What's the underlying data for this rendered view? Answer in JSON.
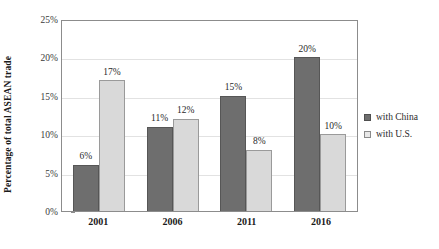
{
  "chart_data": {
    "type": "bar",
    "title": "",
    "subtitle": "",
    "xlabel": "",
    "ylabel": "Percentage of total ASEAN trade",
    "categories": [
      "2001",
      "2006",
      "2011",
      "2016"
    ],
    "series": [
      {
        "name": "with China",
        "color": "#6e6e6e",
        "values": [
          6,
          11,
          15,
          20
        ],
        "labels": [
          "6%",
          "11%",
          "15%",
          "20%"
        ]
      },
      {
        "name": "with U.S.",
        "color": "#d9d9d9",
        "values": [
          17,
          12,
          8,
          10
        ],
        "labels": [
          "17%",
          "12%",
          "8%",
          "10%"
        ]
      }
    ],
    "ylim": [
      0,
      25
    ],
    "yticks": [
      0,
      5,
      10,
      15,
      20,
      25
    ],
    "ytick_labels": [
      "0%",
      "5%",
      "10%",
      "15%",
      "20%",
      "25%"
    ],
    "grid": true,
    "grid_axis": "y",
    "legend_position": "right",
    "value_labels": true
  },
  "legend": {
    "items": [
      {
        "label": "with China",
        "swatch": "series-china"
      },
      {
        "label": "with U.S.",
        "swatch": "series-us"
      }
    ]
  }
}
